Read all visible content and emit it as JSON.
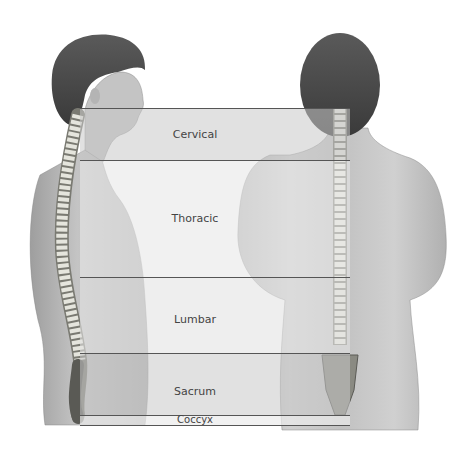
{
  "diagram": {
    "title": "",
    "figures": [
      {
        "name": "side-view",
        "description": "Lateral view of human torso and head showing spinal column"
      },
      {
        "name": "back-view",
        "description": "Posterior view of human torso and head showing spinal column"
      }
    ],
    "regions": [
      {
        "label": "Cervical",
        "top": 108,
        "bottom": 160,
        "fill": "#d4d4d4"
      },
      {
        "label": "Thoracic",
        "top": 160,
        "bottom": 277,
        "fill": "#e8e8e8"
      },
      {
        "label": "Lumbar",
        "top": 277,
        "bottom": 353,
        "fill": "#e2e2e2"
      },
      {
        "label": "Sacrum",
        "top": 353,
        "bottom": 415,
        "fill": "#cfcfcf"
      },
      {
        "label": "Coccyx",
        "top": 415,
        "bottom": 426,
        "fill": "#e6e6e6"
      }
    ],
    "colors": {
      "skin": "#c9c9c9",
      "skin_shadow": "#a8a8a8",
      "hair": "#4a4a4a",
      "bone": "#e9e9e2",
      "bone_shadow": "#8a8a82",
      "line": "#555555",
      "label": "#444444"
    }
  }
}
